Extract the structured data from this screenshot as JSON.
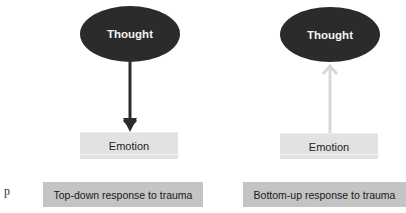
{
  "side_letter": "p",
  "panels": [
    {
      "top_node": "Thought",
      "bottom_node": "Emotion",
      "arrow_direction": "down",
      "arrow_color": "#2b2b2b",
      "caption": "Top-down response to trauma"
    },
    {
      "top_node": "Thought",
      "bottom_node": "Emotion",
      "arrow_direction": "up",
      "arrow_color": "#d8d8d8",
      "caption": "Bottom-up response to trauma"
    }
  ]
}
